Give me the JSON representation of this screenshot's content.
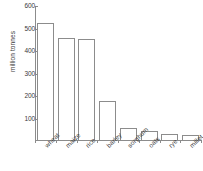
{
  "chart_data": {
    "type": "bar",
    "title": "",
    "xlabel": "",
    "ylabel": "million tonnes",
    "categories": [
      "wheat",
      "maize",
      "rice",
      "barley",
      "sorghum",
      "oats",
      "rye",
      "millet"
    ],
    "values": [
      523,
      458,
      455,
      180,
      60,
      45,
      30,
      27
    ],
    "ylim": [
      0,
      600
    ],
    "yticks": [
      100,
      200,
      300,
      400,
      500,
      600
    ],
    "ytick_labels": [
      "100",
      "200",
      "300",
      "400",
      "500",
      "600"
    ],
    "grid": false,
    "legend": null,
    "bar_color": "#ffffff",
    "bar_edge_color": "#8c8c8c",
    "axis_color": "#8c8c8c",
    "text_color": "#3a3a3a"
  }
}
